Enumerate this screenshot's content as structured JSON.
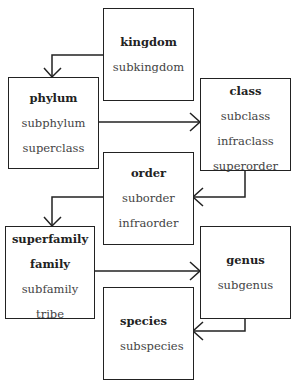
{
  "diagram": {
    "boxes": [
      {
        "id": "kingdom",
        "primary": [
          "kingdom"
        ],
        "secondary": [
          "subkingdom"
        ]
      },
      {
        "id": "phylum",
        "primary": [
          "phylum"
        ],
        "secondary": [
          "subphylum",
          "superclass"
        ]
      },
      {
        "id": "class",
        "primary": [
          "class"
        ],
        "secondary": [
          "subclass",
          "infraclass",
          "superorder"
        ]
      },
      {
        "id": "order",
        "primary": [
          "order"
        ],
        "secondary": [
          "suborder",
          "infraorder"
        ]
      },
      {
        "id": "family",
        "primary": [
          "superfamily",
          "family"
        ],
        "secondary": [
          "subfamily",
          "tribe"
        ]
      },
      {
        "id": "genus",
        "primary": [
          "genus"
        ],
        "secondary": [
          "subgenus"
        ]
      },
      {
        "id": "species",
        "primary": [
          "species"
        ],
        "secondary": [
          "subspecies"
        ]
      }
    ],
    "edges": [
      {
        "from": "kingdom",
        "to": "phylum"
      },
      {
        "from": "phylum",
        "to": "class"
      },
      {
        "from": "class",
        "to": "order"
      },
      {
        "from": "order",
        "to": "family"
      },
      {
        "from": "family",
        "to": "genus"
      },
      {
        "from": "genus",
        "to": "species"
      }
    ],
    "colors": {
      "line": "#222222",
      "text": "#222222",
      "background": "#ffffff"
    }
  }
}
